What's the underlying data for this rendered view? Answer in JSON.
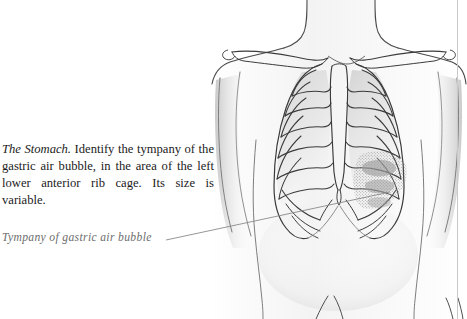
{
  "page": {
    "background_color": "#ffffff",
    "width": 467,
    "height": 319
  },
  "body_text": {
    "run_in_heading": "The Stomach.",
    "paragraph": " Identify the tympany of the gastric air bubble, in the area of the left lower anterior rib cage. Its size is variable.",
    "full_text": "The Stomach. Identify the tympany of the gastric air bubble, in the area of the left lower anterior rib cage. Its size is variable.",
    "color": "#1b1b1b"
  },
  "annotation": {
    "label": "Tympany of gastric air bubble",
    "color": "#6d6d6d",
    "leader_line_color": "#8a8a8a"
  },
  "illustration": {
    "title": "anterior-thorax-with-rib-cage",
    "description": "Pencil drawing of an anterior torso showing neck, shoulders, clavicles, rib cage, sternum and costal margins, with a stippled shaded region over the left lower anterior ribs",
    "shaded_region_name": "gastric-air-bubble-tympany-area",
    "outline_color": "#3a3a3a",
    "shading_color": "#b9b9b9",
    "stipple_color": "#9a9a9a"
  },
  "margin_rule": {
    "color": "#c9c9c9"
  }
}
